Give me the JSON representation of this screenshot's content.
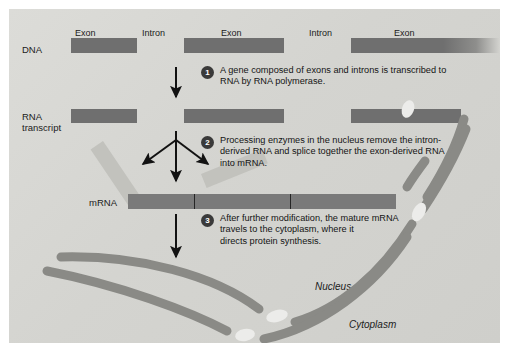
{
  "figure": {
    "background_color": "#d6d6d2",
    "bar_color": "#6f6f6f",
    "fragment_color": "#c2c2bd",
    "membrane_color": "#8a8a86"
  },
  "row_labels": {
    "dna": "DNA",
    "rna_transcript_line1": "RNA",
    "rna_transcript_line2": "transcript",
    "mrna": "mRNA"
  },
  "segment_labels": [
    {
      "text": "Exon",
      "kind": "exon"
    },
    {
      "text": "Intron",
      "kind": "intron"
    },
    {
      "text": "Exon",
      "kind": "exon"
    },
    {
      "text": "Intron",
      "kind": "intron"
    },
    {
      "text": "Exon",
      "kind": "exon"
    }
  ],
  "steps": [
    {
      "number": "1",
      "line1": "A gene composed of exons and introns is transcribed to",
      "line2": "RNA  by RNA polymerase."
    },
    {
      "number": "2",
      "line1": "Processing enzymes in the nucleus remove the intron-",
      "line2": "derived RNA and splice together the exon-derived RNA",
      "line3": "into mRNA."
    },
    {
      "number": "3",
      "line1": "After further modification, the mature mRNA",
      "line2": "travels to the cytoplasm, where it",
      "line3": "directs protein synthesis."
    }
  ],
  "compartments": {
    "nucleus": "Nucleus",
    "cytoplasm": "Cytoplasm"
  },
  "icons": {
    "transcription_arrow": "down-arrow-icon",
    "splice_arrow_left": "diagonal-arrow-left-icon",
    "splice_arrow_down": "down-arrow-icon",
    "splice_arrow_right": "diagonal-arrow-right-icon",
    "export_arrow": "down-arrow-icon"
  }
}
